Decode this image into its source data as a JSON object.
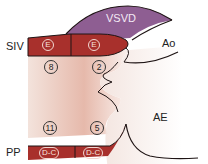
{
  "diagram": {
    "labels": {
      "siv": "SIV",
      "vsvd": "VSVD",
      "ao": "Ao",
      "ae": "AE",
      "pp": "PP"
    },
    "segments": {
      "top_left": "E",
      "top_right": "E",
      "bottom_left": "D-C",
      "bottom_right": "D-C"
    },
    "numbers": {
      "top_left": "8",
      "top_right": "2",
      "bottom_left": "11",
      "bottom_right": "5"
    },
    "colors": {
      "band_red": "#a8302c",
      "vsvd_purple": "#8e5e92",
      "tissue_pink": "#e9bfb2",
      "outline": "#1e1414"
    }
  }
}
